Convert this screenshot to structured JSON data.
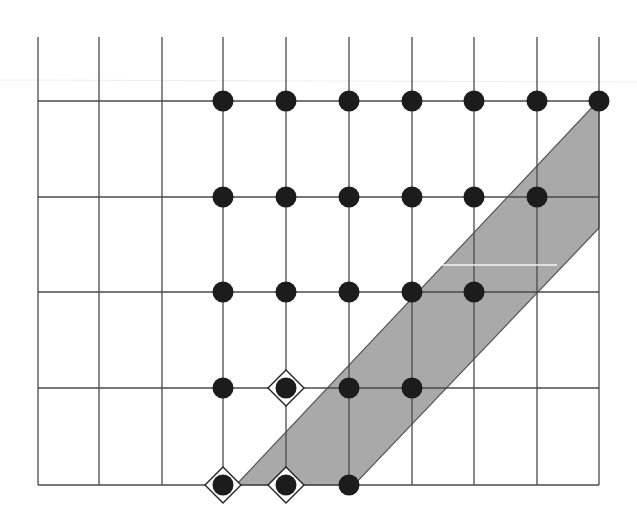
{
  "diagram": {
    "type": "lattice-grid",
    "colors": {
      "background": "#ffffff",
      "grid": "#4a4a4a",
      "band_fill": "#a9a9a9",
      "dot": "#1c1c1c",
      "diamond_stroke": "#222222"
    },
    "grid": {
      "x_lines": [
        38,
        99,
        162,
        223,
        286,
        349,
        412,
        474,
        537,
        599
      ],
      "y_lines": [
        101,
        197,
        292,
        388,
        485
      ],
      "top_extent": 37,
      "left_extent": 38,
      "right_extent": 599,
      "bottom_extent": 485
    },
    "band": {
      "points": [
        [
          236,
          485
        ],
        [
          599,
          100
        ],
        [
          599,
          228
        ],
        [
          354,
          485
        ]
      ]
    },
    "dots": [
      {
        "row": 0,
        "y": 101,
        "xs": [
          223,
          286,
          349,
          412,
          474,
          537,
          599
        ]
      },
      {
        "row": 1,
        "y": 197,
        "xs": [
          223,
          286,
          349,
          412,
          474,
          537
        ]
      },
      {
        "row": 2,
        "y": 292,
        "xs": [
          223,
          286,
          349,
          412,
          474
        ]
      },
      {
        "row": 3,
        "y": 388,
        "xs": [
          223,
          286,
          349,
          412
        ]
      },
      {
        "row": 4,
        "y": 485,
        "xs": [
          223,
          286,
          349
        ]
      }
    ],
    "dot_radius": 10.5,
    "diamonds": [
      {
        "x": 286,
        "y": 388
      },
      {
        "x": 223,
        "y": 485
      },
      {
        "x": 286,
        "y": 485
      }
    ],
    "diamond_half": 18
  }
}
